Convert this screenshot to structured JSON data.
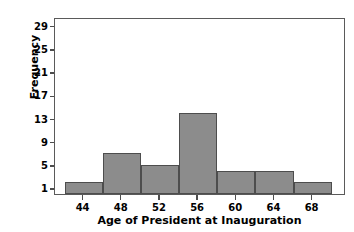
{
  "chart_data": {
    "type": "bar",
    "title": "",
    "xlabel": "Age of President at Inauguration",
    "ylabel": "Frequency",
    "categories": [
      "42-46",
      "46-50",
      "50-54",
      "54-58",
      "58-62",
      "62-66",
      "66-70"
    ],
    "bin_edges": [
      42,
      46,
      50,
      54,
      58,
      62,
      66,
      70
    ],
    "values": [
      2,
      7,
      5,
      14,
      4,
      4,
      2
    ],
    "bin_width": 4,
    "xticks": [
      44,
      48,
      52,
      56,
      60,
      64,
      68
    ],
    "yticks": [
      1,
      5,
      9,
      13,
      17,
      21,
      25,
      29
    ],
    "xlim": [
      41,
      71.5
    ],
    "ylim": [
      0,
      30.5
    ],
    "grid": false,
    "legend": false,
    "bar_color": "#8c8c8c",
    "bar_edge_color": "#4d4d4d",
    "frame_color": "#5a5a5a",
    "background": "#ffffff"
  }
}
